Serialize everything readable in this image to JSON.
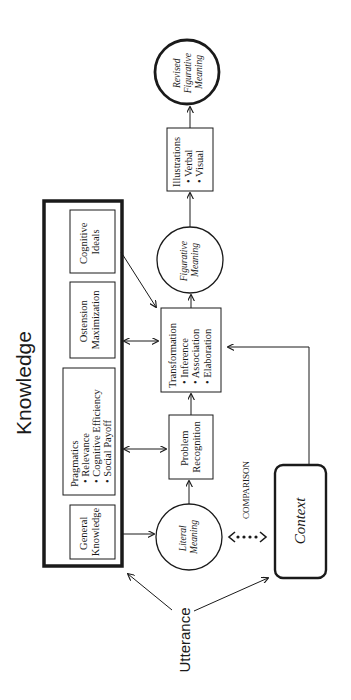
{
  "diagram": {
    "orientation": "rotated-90-ccw",
    "knowledge": {
      "title": "Knowledge",
      "boxes": {
        "cognitive_ideals": [
          "Cognitive",
          "Ideals"
        ],
        "ostension": [
          "Ostension",
          "Maximization"
        ],
        "pragmatics": {
          "title": "Pragmatics",
          "items": [
            "• Relevance",
            "• Cognitive Efficiency",
            "• Social Payoff"
          ]
        },
        "general_knowledge": [
          "General",
          "Knowledge"
        ]
      }
    },
    "utterance": "Utterance",
    "literal_meaning": [
      "Literal",
      "Meaning"
    ],
    "comparison": "COMPARISON",
    "context": "Context",
    "problem_recognition": [
      "Problem",
      "Recognition"
    ],
    "transformation": {
      "title": "Transformation",
      "items": [
        "• Inference",
        "• Association",
        "• Elaboration"
      ]
    },
    "figurative_meaning": [
      "Figurative",
      "Meaning"
    ],
    "illustrations": {
      "title": "Illustrations",
      "items": [
        "• Verbal",
        "• Visual"
      ]
    },
    "revised_figurative_meaning": [
      "Revised",
      "Figurative",
      "Meaning"
    ],
    "colors": {
      "stroke": "#1a1a1a",
      "background": "#ffffff"
    }
  }
}
